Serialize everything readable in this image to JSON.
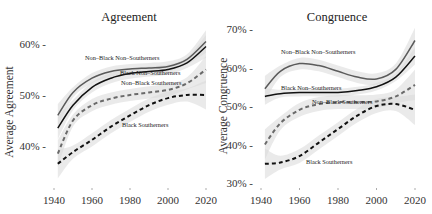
{
  "chart_data": [
    {
      "type": "line",
      "title": "Agreement",
      "xlabel": "",
      "ylabel": "Average Agreement",
      "xlim": [
        1940,
        2020
      ],
      "ylim": [
        33,
        62
      ],
      "x_ticks": [
        1940,
        1960,
        1980,
        2000,
        2020
      ],
      "x_tick_labels": [
        "1940",
        "1960",
        "1980",
        "2000",
        "2020"
      ],
      "y_ticks": [
        40,
        50,
        60
      ],
      "y_tick_labels": [
        "40% -",
        "50% -",
        "60% -"
      ],
      "grid": false,
      "legend": "inline labels",
      "confidence_bands": true,
      "x": [
        1942,
        1950,
        1960,
        1970,
        1980,
        1990,
        2000,
        2010,
        2020
      ],
      "series": [
        {
          "name": "Non-Black Non-Southerners",
          "style": "solid",
          "color": "#5a5a5a",
          "values": [
            46.0,
            50.5,
            53.3,
            54.6,
            55.1,
            55.3,
            55.6,
            57.0,
            60.5
          ]
        },
        {
          "name": "Black Non-Southerners",
          "style": "solid",
          "color": "#111111",
          "values": [
            43.5,
            48.0,
            51.5,
            53.3,
            54.2,
            54.6,
            55.0,
            56.3,
            59.5
          ]
        },
        {
          "name": "Non-Black Southerners",
          "style": "dashed",
          "color": "#6a6a6a",
          "values": [
            38.5,
            45.0,
            48.0,
            49.3,
            50.0,
            50.5,
            51.0,
            52.3,
            55.0
          ]
        },
        {
          "name": "Black Southerners",
          "style": "dashed",
          "color": "#111111",
          "values": [
            36.5,
            38.8,
            41.2,
            43.8,
            46.0,
            48.0,
            49.4,
            50.0,
            50.0
          ]
        }
      ]
    },
    {
      "type": "line",
      "title": "Congruence",
      "xlabel": "",
      "ylabel": "Average Congruence",
      "xlim": [
        1940,
        2020
      ],
      "ylim": [
        29,
        72
      ],
      "x_ticks": [
        1940,
        1960,
        1980,
        2000,
        2020
      ],
      "x_tick_labels": [
        "1940",
        "1960",
        "1980",
        "2000",
        "2020"
      ],
      "y_ticks": [
        30,
        40,
        50,
        60,
        70
      ],
      "y_tick_labels": [
        "30% -",
        "40% -",
        "50% -",
        "60% -",
        "70% -"
      ],
      "grid": false,
      "legend": "inline labels",
      "confidence_bands": true,
      "x": [
        1942,
        1950,
        1960,
        1970,
        1980,
        1990,
        2000,
        2010,
        2020
      ],
      "series": [
        {
          "name": "Non-Black Non-Southerners",
          "style": "solid",
          "color": "#5a5a5a",
          "values": [
            54.5,
            59.0,
            61.0,
            60.5,
            59.0,
            57.5,
            57.0,
            59.5,
            67.0
          ]
        },
        {
          "name": "Black Non-Southerners",
          "style": "solid",
          "color": "#111111",
          "values": [
            52.5,
            53.2,
            53.5,
            53.5,
            53.5,
            54.0,
            55.0,
            57.5,
            63.0
          ]
        },
        {
          "name": "Non-Black Southerners",
          "style": "dashed",
          "color": "#6a6a6a",
          "values": [
            40.0,
            45.5,
            49.0,
            50.5,
            51.0,
            51.0,
            51.2,
            52.5,
            55.5
          ]
        },
        {
          "name": "Black Southerners",
          "style": "dashed",
          "color": "#111111",
          "values": [
            35.0,
            35.3,
            37.0,
            40.5,
            44.0,
            47.5,
            50.0,
            50.5,
            49.0
          ]
        }
      ]
    }
  ],
  "labels": {
    "left_title": "Agreement",
    "right_title": "Congruence",
    "left_ylabel": "Average Agreement",
    "right_ylabel": "Average Congruence",
    "nbns": "Non–Black Non–Southerners",
    "bns": "Black Non–Southerners",
    "nbs": "Non–Black Southerners",
    "bs": "Black Southerners"
  },
  "colors": {
    "band": "#d9d9d9",
    "grey_line": "#5a5a5a",
    "black_line": "#111111",
    "text": "#333333"
  }
}
